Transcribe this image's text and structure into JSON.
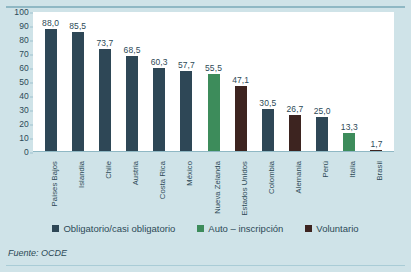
{
  "chart_data": {
    "type": "bar",
    "title": "",
    "xlabel": "",
    "ylabel": "",
    "ylim": [
      0,
      100
    ],
    "yticks": [
      0,
      10,
      20,
      30,
      40,
      50,
      60,
      70,
      80,
      90,
      100
    ],
    "grid": false,
    "legend_position": "bottom",
    "categories": [
      "Países Bajos",
      "Islandia",
      "Chile",
      "Austria",
      "Costa Rica",
      "México",
      "Nueva Zelanda",
      "Estados Unidos",
      "Colombia",
      "Alemania",
      "Perú",
      "Italia",
      "Brasil"
    ],
    "values": [
      88.0,
      85.5,
      73.7,
      68.5,
      60.3,
      57.7,
      55.5,
      47.1,
      30.5,
      26.7,
      25.0,
      13.3,
      1.7
    ],
    "value_labels": [
      "88,0",
      "85,5",
      "73,7",
      "68,5",
      "60,3",
      "57,7",
      "55,5",
      "47,1",
      "30,5",
      "26,7",
      "25,0",
      "13,3",
      "1,7"
    ],
    "point_categories": [
      "obligatorio",
      "obligatorio",
      "obligatorio",
      "obligatorio",
      "obligatorio",
      "obligatorio",
      "auto",
      "voluntario",
      "obligatorio",
      "voluntario",
      "obligatorio",
      "auto",
      "voluntario"
    ],
    "legend": [
      {
        "key": "obligatorio",
        "label": "Obligatorio/casi obligatorio",
        "color": "#2e4756"
      },
      {
        "key": "auto",
        "label": "Auto – inscripción",
        "color": "#3d8c5b"
      },
      {
        "key": "voluntario",
        "label": "Voluntario",
        "color": "#3d2420"
      }
    ],
    "colors": {
      "obligatorio": "#2e4756",
      "auto": "#3d8c5b",
      "voluntario": "#3d2420"
    },
    "source": "Fuente: OCDE",
    "background": "#cfe3e8",
    "plot_background": "#ffffff"
  }
}
